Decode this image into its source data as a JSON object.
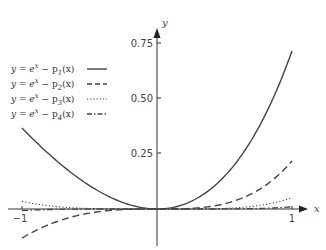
{
  "chart_data": {
    "type": "line",
    "title": "",
    "xlabel": "x",
    "ylabel": "y",
    "xlim": [
      -1,
      1
    ],
    "ylim": [
      -0.15,
      0.8
    ],
    "x_ticks": [
      "-1",
      "1"
    ],
    "y_ticks": [
      "0.25",
      "0.50",
      "0.75"
    ],
    "grid": false,
    "legend_position": "upper-left",
    "x": [
      -1,
      -0.5,
      0,
      0.5,
      1
    ],
    "series": [
      {
        "name": "y = e^x − p1(x)",
        "style": "solid",
        "values": [
          0.368,
          0.107,
          0,
          0.149,
          0.718
        ]
      },
      {
        "name": "y = e^x − p2(x)",
        "style": "dashed",
        "values": [
          -0.132,
          -0.018,
          0,
          0.024,
          0.218
        ]
      },
      {
        "name": "y = e^x − p3(x)",
        "style": "dotted",
        "values": [
          0.035,
          0.002,
          0,
          0.003,
          0.052
        ]
      },
      {
        "name": "y = e^x − p4(x)",
        "style": "dash-dot",
        "values": [
          -0.007,
          0,
          0,
          0,
          0.01
        ]
      }
    ]
  },
  "legend": [
    {
      "prefix": "y = e",
      "sup": "x",
      "mid": " − p",
      "sub": "1",
      "suffix": "(x)"
    },
    {
      "prefix": "y = e",
      "sup": "x",
      "mid": " − p",
      "sub": "2",
      "suffix": "(x)"
    },
    {
      "prefix": "y = e",
      "sup": "x",
      "mid": " − p",
      "sub": "3",
      "suffix": "(x)"
    },
    {
      "prefix": "y = e",
      "sup": "x",
      "mid": " − p",
      "sub": "4",
      "suffix": "(x)"
    }
  ],
  "axes": {
    "x_label": "x",
    "y_label": "y",
    "x_tick_left": "−1",
    "x_tick_right": "1",
    "y_tick_1": "0.25",
    "y_tick_2": "0.50",
    "y_tick_3": "0.75"
  }
}
